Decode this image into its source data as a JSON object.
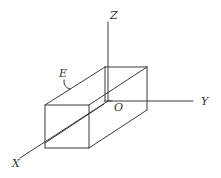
{
  "diagram": {
    "type": "3d-coordinate-box",
    "colors": {
      "stroke": "#3a3a3a",
      "background": "#ffffff",
      "label": "#333333"
    },
    "labels": {
      "z_axis": "Z",
      "y_axis": "Y",
      "x_axis": "X",
      "origin": "O",
      "edge": "E"
    }
  }
}
